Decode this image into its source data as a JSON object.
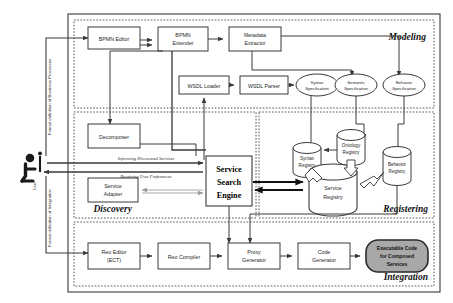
{
  "diagram": {
    "phases": [
      {
        "id": "modeling",
        "label": "Modeling"
      },
      {
        "id": "discovery",
        "label": "Discovery"
      },
      {
        "id": "registering",
        "label": "Registering"
      },
      {
        "id": "integration",
        "label": "Integration"
      }
    ],
    "actor": {
      "name": "user-actor",
      "label": "User"
    },
    "vertical_labels": [
      {
        "id": "formal-business",
        "text": "Formal definition of Business Processes"
      },
      {
        "id": "formal-integration",
        "text": "Formal definition of Integration"
      }
    ],
    "modeling_nodes": [
      {
        "id": "bpmn-editor",
        "line1": "BPMN Editor",
        "line2": ""
      },
      {
        "id": "bpmn-extender",
        "line1": "BPMN",
        "line2": "Extender"
      },
      {
        "id": "metadata-extractor",
        "line1": "Metadata",
        "line2": "Extractor"
      },
      {
        "id": "wsdl-loader",
        "line1": "WSDL Loader",
        "line2": ""
      },
      {
        "id": "wsdl-parser",
        "line1": "WSDL Parser",
        "line2": ""
      }
    ],
    "specifications": [
      {
        "id": "syntax-specification",
        "line1": "Syntax",
        "line2": "Specification"
      },
      {
        "id": "semantic-specification",
        "line1": "Semantic",
        "line2": "Specification"
      },
      {
        "id": "behavior-specification",
        "line1": "Behavior",
        "line2": "Specification"
      }
    ],
    "discovery_nodes": [
      {
        "id": "decomposer",
        "line1": "Decomposer",
        "line2": ""
      },
      {
        "id": "service-adapter",
        "line1": "Service",
        "line2": "Adapter"
      }
    ],
    "search_engine": {
      "id": "service-search-engine",
      "line1": "Service",
      "line2": "Search",
      "line3": "Engine"
    },
    "discovery_flows": [
      {
        "id": "informing-discovered-services",
        "text": "Informing Discovered Services"
      },
      {
        "id": "receiving-user-preferences",
        "text": "Receiving User Preferences"
      }
    ],
    "registries": [
      {
        "id": "syntax-registry",
        "line1": "Syntax",
        "line2": "Registry"
      },
      {
        "id": "ontology-registry",
        "line1": "Ontology",
        "line2": "Registry"
      },
      {
        "id": "behavior-registry",
        "line1": "Behavior",
        "line2": "Registry"
      },
      {
        "id": "service-registry",
        "line1": "Service",
        "line2": "Registry"
      }
    ],
    "integration_nodes": [
      {
        "id": "reo-editor",
        "line1": "Reo Editor",
        "line2": "(ECT)"
      },
      {
        "id": "reo-compiler",
        "line1": "Reo Compiler",
        "line2": ""
      },
      {
        "id": "proxy-generator",
        "line1": "Proxy",
        "line2": "Generator"
      },
      {
        "id": "code-generator",
        "line1": "Code",
        "line2": "Generator"
      }
    ],
    "output_node": {
      "id": "executable-code",
      "line1": "Executable Code",
      "line2": "for Composed",
      "line3": "Services"
    },
    "colors": {
      "stroke": "#3a3a3a",
      "dashed": "#555555",
      "fill": "#ffffff",
      "output_fill": "#a8a8a8",
      "text": "#1a1a1a"
    }
  }
}
